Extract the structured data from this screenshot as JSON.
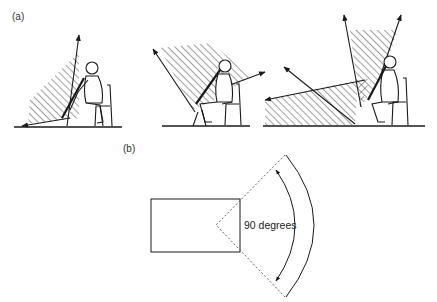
{
  "panels": {
    "a": {
      "label": "(a)",
      "figures": [
        {
          "name": "seated-oboist-sound-radiation-upward",
          "description": "Seated player; hatched radiation sector to the left between upward arrow and floor-level arrow"
        },
        {
          "name": "seated-oboist-sound-radiation-forward",
          "description": "Seated player; hatched radiation sector between upper-left arrow and forward-right arrow"
        },
        {
          "name": "seated-oboist-sound-radiation-reflections",
          "description": "Seated player; two upward arrows forming hatched cone plus long left arrow with floor reflection hatched sector"
        }
      ]
    },
    "b": {
      "label": "(b)",
      "angle_label": "90 degrees",
      "shapes": [
        "rectangle",
        "dashed-angle-lines",
        "double-headed-arc-arrow",
        "outer-arc"
      ]
    }
  },
  "colors": {
    "ink": "#1a1a1a",
    "hatch": "#2a2a2a",
    "dash": "#555555"
  }
}
